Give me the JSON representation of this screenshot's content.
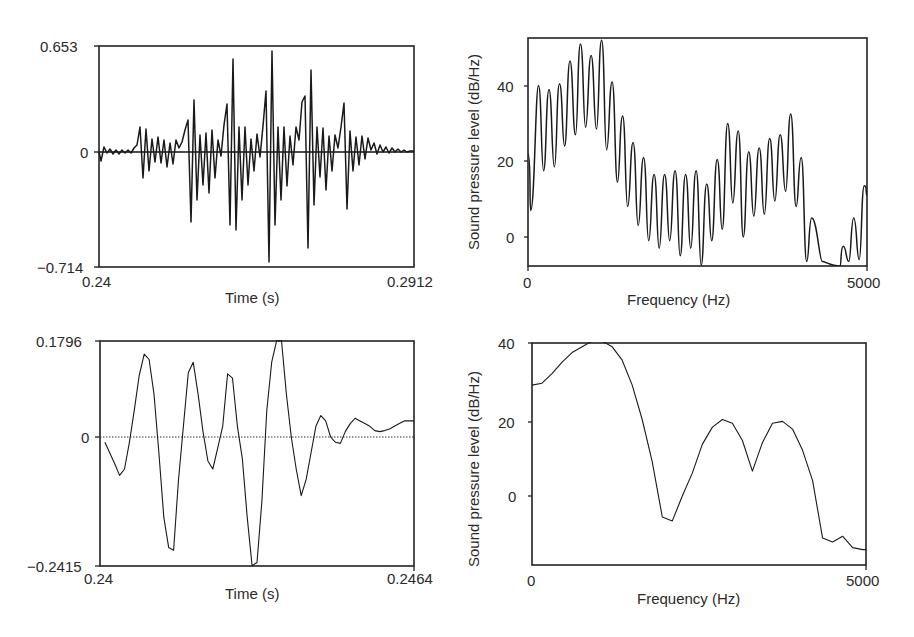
{
  "chart_data": [
    {
      "id": "top-left",
      "type": "line",
      "title": "",
      "xlabel": "Time (s)",
      "ylabel": "",
      "xlim": [
        0.24,
        0.2912
      ],
      "ylim": [
        -0.714,
        0.653
      ],
      "x_tick_labels": [
        "0.24",
        "0.2912"
      ],
      "y_tick_labels": [
        "0.653",
        "0",
        "-0.714"
      ],
      "zero_line": "solid",
      "grid": false,
      "description": "Speech waveform (amplitude vs time), periodic glottal pulses with decaying oscillations",
      "series": [
        {
          "name": "waveform",
          "x": [
            0.24,
            0.2402,
            0.2405,
            0.2408,
            0.2411,
            0.2414,
            0.2417,
            0.242,
            0.2423,
            0.2426,
            0.2429,
            0.2432,
            0.2435,
            0.2438,
            0.2441,
            0.2444,
            0.2447,
            0.245,
            0.2453,
            0.2456,
            0.2459,
            0.2462,
            0.2465,
            0.2468,
            0.2471,
            0.2474,
            0.2477,
            0.248,
            0.2483,
            0.2486,
            0.2489,
            0.2492,
            0.2495,
            0.2498,
            0.2501,
            0.2504,
            0.2507,
            0.251,
            0.2513,
            0.2516,
            0.2519,
            0.2522,
            0.2525,
            0.2528,
            0.2531,
            0.2534,
            0.2537,
            0.254,
            0.2543,
            0.2546,
            0.2549,
            0.2552,
            0.2555,
            0.2558,
            0.2561,
            0.2564,
            0.2567,
            0.257,
            0.2573,
            0.2576,
            0.2579,
            0.2582,
            0.2585,
            0.2588,
            0.2591,
            0.2594,
            0.2597,
            0.26,
            0.2603,
            0.2606,
            0.2609,
            0.2612,
            0.2615,
            0.2618,
            0.2621,
            0.2624,
            0.2627,
            0.263,
            0.2633,
            0.2636,
            0.2639,
            0.2642,
            0.2645,
            0.2648,
            0.2651,
            0.2654,
            0.2657,
            0.266,
            0.2663,
            0.2666,
            0.2669,
            0.2672,
            0.2675,
            0.2678,
            0.2681,
            0.2684,
            0.2687,
            0.269,
            0.2693,
            0.2696,
            0.2699,
            0.2702,
            0.2705,
            0.2708,
            0.2711,
            0.2714,
            0.2717,
            0.272,
            0.2723,
            0.2726,
            0.2729,
            0.2732,
            0.2735,
            0.2738,
            0.2741,
            0.2744,
            0.2747,
            0.275,
            0.2753,
            0.2756,
            0.2759,
            0.2762,
            0.2765,
            0.2768,
            0.2771,
            0.2774,
            0.2777,
            0.278,
            0.2783,
            0.2786,
            0.2789,
            0.2792,
            0.2795,
            0.2798,
            0.2801,
            0.2804,
            0.2807,
            0.281,
            0.2813,
            0.2816,
            0.2819,
            0.2822,
            0.2825,
            0.2828,
            0.2831,
            0.2834,
            0.2837,
            0.284,
            0.2843,
            0.2846,
            0.2849,
            0.2852,
            0.2855,
            0.2858,
            0.2861,
            0.2864,
            0.2867,
            0.287,
            0.2873,
            0.2876,
            0.2879,
            0.2882,
            0.2885,
            0.2888,
            0.2891,
            0.2894,
            0.2897,
            0.29,
            0.2903,
            0.2906,
            0.2909,
            0.2912
          ],
          "y": [
            -0.02,
            -0.12,
            0.06,
            -0.04,
            0.03,
            -0.03,
            0.02,
            -0.04,
            0.03,
            -0.02,
            0.02,
            -0.03,
            0.03,
            -0.02,
            0.05,
            0.05,
            0.15,
            -0.28,
            0.27,
            -0.22,
            0.1,
            -0.08,
            0.12,
            -0.06,
            0.07,
            -0.14,
            0.16,
            -0.1,
            0.1,
            -0.02,
            0.06,
            0.04,
            0.13,
            0.12,
            0.27,
            -0.45,
            0.55,
            -0.31,
            0.16,
            -0.09,
            0.16,
            -0.16,
            0.22,
            -0.22,
            0.12,
            -0.04,
            0.07,
            0.11,
            0.43,
            -0.62,
            0.7,
            -0.45,
            0.22,
            -0.15,
            0.22,
            -0.28,
            0.27,
            -0.16,
            0.21,
            -0.04,
            0.12,
            0.08,
            0.27,
            0.12,
            0.56,
            -0.7,
            0.65,
            -0.53,
            0.26,
            -0.16,
            0.23,
            -0.24,
            0.2,
            -0.13,
            0.21,
            -0.04,
            0.09,
            0.05,
            0.28,
            0.14,
            0.41,
            -0.69,
            0.61,
            -0.31,
            0.21,
            -0.19,
            0.22,
            -0.28,
            0.21,
            -0.15,
            0.16,
            -0.06,
            0.14,
            0.05,
            0.27,
            0.12,
            0.47,
            -0.33,
            0.28,
            -0.12,
            0.16,
            -0.2,
            0.15,
            -0.08,
            0.1,
            -0.06,
            0.08,
            0.04,
            0.1,
            0.06,
            0.18,
            -0.08,
            0.07,
            -0.06,
            0.04,
            -0.04,
            0.04,
            -0.02,
            0.03,
            -0.02,
            0.03,
            -0.01,
            0.02,
            -0.01,
            0.02,
            0.0,
            0.01,
            0.0,
            0.0,
            0.0,
            0.0,
            0.0,
            0.0,
            0.0,
            0.0,
            0.0,
            0.0,
            0.0,
            0.0,
            0.0,
            0.0,
            0.0,
            0.0,
            0.0,
            0.0,
            0.0,
            0.0,
            0.0,
            0.0,
            0.0,
            0.0,
            0.0,
            0.0,
            0.0,
            0.0,
            0.0,
            0.0,
            0.0,
            0.0,
            0.0,
            0.0,
            0.0,
            0.0,
            0.0,
            0.0,
            0.0,
            0.0,
            0.0
          ]
        }
      ],
      "extrema_pixel_path": "99,152 101,161 104,147 107,153 110,149 113,154 116,150 119,154 122,150 125,153 128,150 131,153 134,148 137,145 140,127 143,178 146,129 149,171 152,139 155,162 158,137 161,163 164,140 167,167 170,143 173,164 176,140 179,148 182,142 185,130 188,120 191,222 194,100 197,200 200,135 203,185 206,133 209,193 212,130 215,178 218,140 221,156 224,125 227,104 230,225 233,59 236,230 239,127 242,200 245,127 248,185 251,139 254,171 257,134 260,157 263,126 266,91 269,262 272,51 275,225 278,127 281,200 284,127 287,186 290,136 293,165 296,127 299,140 302,102 305,96 308,248 311,70 314,205 317,127 320,177 323,128 326,190 329,136 332,171 335,135 338,148 341,127 344,103 347,209 350,131 353,171 356,137 359,165 362,136 365,159 368,138 371,150 374,143 377,154 380,145 383,152 386,147 389,153 392,148 395,152 398,149 401,152 404,150 407,152 410,151 414,151",
      "extrema_pixel_path_note": "pixel-space trace used for rendering in the recreated page"
    },
    {
      "id": "top-right",
      "type": "line",
      "title": "",
      "xlabel": "Frequency (Hz)",
      "ylabel": "Sound pressure level (dB/Hz)",
      "xlim": [
        0,
        5000
      ],
      "ylim": [
        -7.7,
        52.6
      ],
      "x_tick_labels": [
        "0",
        "5000"
      ],
      "y_ticks": [
        0,
        20,
        40
      ],
      "grid": false,
      "description": "Narrow-band spectrum showing harmonics; envelope peak ~51 dB near 1100 Hz, second formant region ~3500-3900 Hz",
      "harmonic_peaks": {
        "x": [
          155,
          310,
          465,
          620,
          775,
          930,
          1085,
          1240,
          1395,
          1550,
          1705,
          1860,
          2015,
          2170,
          2325,
          2480,
          2635,
          2790,
          2945,
          3100,
          3255,
          3410,
          3565,
          3720,
          3875,
          4030,
          4185,
          4340,
          4650,
          4805,
          4960
        ],
        "y": [
          40,
          39,
          40.5,
          46.5,
          51,
          48,
          52,
          41,
          32,
          25,
          21,
          16.5,
          16.5,
          17.5,
          16.5,
          17.5,
          14,
          20.5,
          30,
          28,
          22.5,
          23.5,
          26,
          27,
          32.5,
          21,
          5,
          -6.5,
          -2.5,
          5,
          13.5
        ]
      },
      "troughs": {
        "x": [
          40,
          230,
          390,
          540,
          700,
          850,
          1010,
          1160,
          1320,
          1470,
          1625,
          1780,
          1935,
          2090,
          2245,
          2400,
          2555,
          2710,
          2865,
          3020,
          3175,
          3330,
          3485,
          3640,
          3800,
          3955,
          4110,
          4600,
          4730,
          4885
        ],
        "y": [
          7,
          17.5,
          18.5,
          24,
          27,
          29,
          28.5,
          23,
          14.5,
          8,
          3,
          -1,
          -3,
          -1,
          -5,
          -3,
          -7.5,
          -1,
          2,
          9,
          0,
          5.5,
          6,
          9.5,
          12,
          8,
          -6.5,
          -7.7,
          -6.5,
          -6
        ]
      }
    },
    {
      "id": "bottom-left",
      "type": "line",
      "title": "",
      "xlabel": "Time (s)",
      "ylabel": "",
      "xlim": [
        0.24,
        0.2464
      ],
      "ylim": [
        -0.2415,
        0.1796
      ],
      "x_tick_labels": [
        "0.24",
        "0.2464"
      ],
      "y_tick_labels": [
        "0.1796",
        "0",
        "-0.2415"
      ],
      "zero_line": "dotted",
      "grid": false,
      "description": "Single pitch period of waveform (zoomed)",
      "series": [
        {
          "name": "waveform",
          "x": [
            0.2401,
            0.2403,
            0.2404,
            0.2405,
            0.2406,
            0.2407,
            0.2408,
            0.2409,
            0.241,
            0.2411,
            0.2412,
            0.2413,
            0.2414,
            0.2415,
            0.2416,
            0.2417,
            0.2418,
            0.2419,
            0.242,
            0.2421,
            0.2422,
            0.2423,
            0.2424,
            0.2425,
            0.2426,
            0.2427,
            0.2428,
            0.2429,
            0.243,
            0.2431,
            0.2432,
            0.2433,
            0.2434,
            0.2435,
            0.2436,
            0.2437,
            0.2438,
            0.2439,
            0.244,
            0.2441,
            0.2442,
            0.2443,
            0.2444,
            0.2445,
            0.2446,
            0.2447,
            0.2448,
            0.2449,
            0.245,
            0.2451,
            0.2452,
            0.2453,
            0.2454,
            0.2455,
            0.2456,
            0.2457,
            0.2458,
            0.2459,
            0.246,
            0.2461,
            0.2462,
            0.2463,
            0.2464
          ],
          "y": [
            -0.01,
            -0.05,
            -0.072,
            -0.06,
            -0.01,
            0.05,
            0.115,
            0.155,
            0.145,
            0.08,
            -0.03,
            -0.15,
            -0.207,
            -0.212,
            -0.08,
            0.02,
            0.12,
            0.14,
            0.08,
            0.01,
            -0.045,
            -0.06,
            -0.02,
            0.02,
            0.118,
            0.11,
            0.02,
            -0.04,
            -0.15,
            -0.241,
            -0.235,
            -0.12,
            0.05,
            0.14,
            0.18,
            0.18,
            0.08,
            0.0,
            -0.06,
            -0.11,
            -0.08,
            -0.03,
            0.02,
            0.04,
            0.03,
            0.0,
            -0.01,
            -0.012,
            0.01,
            0.025,
            0.035,
            0.03,
            0.025,
            0.02,
            0.012,
            0.01,
            0.012,
            0.015,
            0.02,
            0.025,
            0.03,
            0.03,
            0.03
          ]
        }
      ]
    },
    {
      "id": "bottom-right",
      "type": "line",
      "title": "",
      "xlabel": "Frequency (Hz)",
      "ylabel": "Sound pressure level (dB/Hz)",
      "xlim": [
        0,
        5000
      ],
      "ylim": [
        -18,
        40.5
      ],
      "x_tick_labels": [
        "0",
        "5000"
      ],
      "y_ticks": [
        0,
        20,
        40
      ],
      "grid": false,
      "description": "Spectrum of single period showing formant envelope",
      "series": [
        {
          "name": "spectrum",
          "x": [
            0,
            150,
            300,
            450,
            600,
            750,
            900,
            1050,
            1200,
            1350,
            1500,
            1650,
            1800,
            1950,
            2100,
            2250,
            2400,
            2550,
            2700,
            2850,
            3000,
            3150,
            3300,
            3450,
            3600,
            3750,
            3900,
            4050,
            4200,
            4350,
            4500,
            4650,
            4800,
            4950,
            5000
          ],
          "y": [
            29,
            29.5,
            32,
            35,
            37.5,
            39,
            40.5,
            40.5,
            39,
            35.5,
            29,
            20,
            9,
            -5.5,
            -6.5,
            0,
            6,
            13.5,
            18,
            20,
            19,
            14.5,
            6.5,
            14,
            19,
            19.5,
            17.5,
            12,
            4,
            -11,
            -12,
            -10.5,
            -13.5,
            -14,
            -14
          ]
        }
      ]
    }
  ],
  "labels": {
    "top_left": {
      "ymax": "0.653",
      "yzero": "0",
      "ymin": "−0.714",
      "xmin": "0.24",
      "xmax": "0.2912",
      "xlabel": "Time (s)"
    },
    "top_right": {
      "y40": "40",
      "y20": "20",
      "y0": "0",
      "xmin": "0",
      "xmax": "5000",
      "xlabel": "Frequency (Hz)",
      "ylabel": "Sound pressure level (dB/Hz)"
    },
    "bottom_left": {
      "ymax": "0.1796",
      "yzero": "0",
      "ymin": "−0.2415",
      "xmin": "0.24",
      "xmax": "0.2464",
      "xlabel": "Time (s)"
    },
    "bottom_right": {
      "y40": "40",
      "y20": "20",
      "y0": "0",
      "xmin": "0",
      "xmax": "5000",
      "xlabel": "Frequency (Hz)",
      "ylabel": "Sound pressure level (dB/Hz)"
    }
  },
  "colors": {
    "line": "#1a1a1a",
    "frame": "#222222",
    "text": "#2a2a2a",
    "background": "#ffffff"
  }
}
